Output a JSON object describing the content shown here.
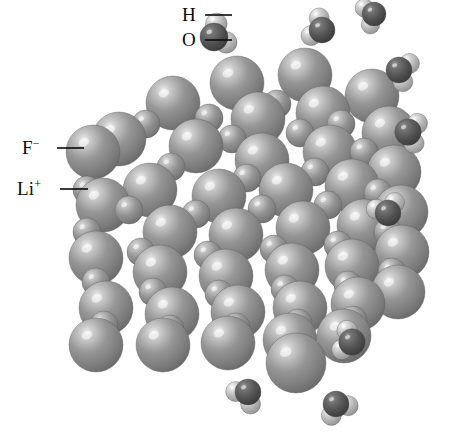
{
  "figure": {
    "name": "lithium-fluoride-crystal-dissolving-in-water",
    "background": "#ffffff",
    "width": 451,
    "height": 445
  },
  "labels": [
    {
      "id": "h",
      "text": "H",
      "sup": "",
      "x": 182,
      "y": 5,
      "leader": {
        "x1": 205,
        "y1": 15,
        "x2": 232,
        "y2": 15
      }
    },
    {
      "id": "o",
      "text": "O",
      "sup": "",
      "x": 182,
      "y": 30,
      "leader": {
        "x1": 205,
        "y1": 40,
        "x2": 232,
        "y2": 40
      }
    },
    {
      "id": "f",
      "text": "F",
      "sup": "−",
      "x": 22,
      "y": 138,
      "leader": {
        "x1": 57,
        "y1": 148,
        "x2": 84,
        "y2": 148
      }
    },
    {
      "id": "li",
      "text": "Li",
      "sup": "+",
      "x": 17,
      "y": 179,
      "leader": {
        "x1": 60,
        "y1": 189,
        "x2": 88,
        "y2": 189
      }
    }
  ],
  "species": {
    "fluoride": {
      "label": "F−",
      "role": "large anion",
      "base_color": "#8e8e8e",
      "highlight_color": "#e9e9e9",
      "shadow_color": "#5e5e5e",
      "radius_px": 27
    },
    "lithium": {
      "label": "Li+",
      "role": "small cation",
      "base_color": "#8e8e8e",
      "highlight_color": "#e0e0e0",
      "shadow_color": "#5e5e5e",
      "radius_px": 14
    },
    "oxygen": {
      "label": "O",
      "role": "water oxygen",
      "base_color": "#565656",
      "highlight_color": "#9a9a9a",
      "shadow_color": "#303030",
      "radius_px": 13
    },
    "hydrogen": {
      "label": "H",
      "role": "water hydrogen",
      "base_color": "#b4b4b4",
      "highlight_color": "#f2f2f2",
      "shadow_color": "#808080",
      "radius_px": 10
    }
  },
  "crystal": {
    "name": "lithium-fluoride-lattice",
    "lattice_type": "rock-salt (face-centered cubic)",
    "anion_positions": [
      [
        237,
        83
      ],
      [
        305,
        75
      ],
      [
        372,
        96
      ],
      [
        173,
        103
      ],
      [
        119,
        139
      ],
      [
        258,
        119
      ],
      [
        323,
        113
      ],
      [
        389,
        133
      ],
      [
        196,
        146
      ],
      [
        262,
        160
      ],
      [
        330,
        152
      ],
      [
        394,
        172
      ],
      [
        93,
        152
      ],
      [
        150,
        190
      ],
      [
        219,
        196
      ],
      [
        286,
        190
      ],
      [
        352,
        186
      ],
      [
        401,
        212
      ],
      [
        103,
        205
      ],
      [
        170,
        232
      ],
      [
        236,
        235
      ],
      [
        303,
        228
      ],
      [
        364,
        226
      ],
      [
        402,
        252
      ],
      [
        96,
        258
      ],
      [
        160,
        272
      ],
      [
        226,
        276
      ],
      [
        292,
        270
      ],
      [
        352,
        266
      ],
      [
        398,
        292
      ],
      [
        106,
        308
      ],
      [
        172,
        314
      ],
      [
        238,
        312
      ],
      [
        300,
        308
      ],
      [
        358,
        304
      ],
      [
        96,
        345
      ],
      [
        163,
        345
      ],
      [
        228,
        343
      ],
      [
        290,
        340
      ],
      [
        344,
        336
      ]
    ],
    "cation_positions": [
      [
        209,
        118
      ],
      [
        277,
        104
      ],
      [
        341,
        124
      ],
      [
        146,
        124
      ],
      [
        232,
        139
      ],
      [
        300,
        133
      ],
      [
        364,
        152
      ],
      [
        171,
        167
      ],
      [
        87,
        190
      ],
      [
        247,
        178
      ],
      [
        315,
        172
      ],
      [
        378,
        193
      ],
      [
        129,
        210
      ],
      [
        196,
        214
      ],
      [
        262,
        209
      ],
      [
        328,
        205
      ],
      [
        388,
        232
      ],
      [
        87,
        232
      ],
      [
        141,
        252
      ],
      [
        208,
        255
      ],
      [
        274,
        249
      ],
      [
        338,
        245
      ],
      [
        392,
        272
      ],
      [
        96,
        282
      ],
      [
        153,
        292
      ],
      [
        219,
        294
      ],
      [
        285,
        289
      ],
      [
        348,
        285
      ],
      [
        104,
        325
      ],
      [
        170,
        329
      ],
      [
        236,
        327
      ],
      [
        298,
        323
      ],
      [
        353,
        320
      ]
    ],
    "detached_ion": {
      "x": 296,
      "y": 363,
      "r": 30,
      "species": "fluoride"
    }
  },
  "water_molecules": [
    {
      "id": "labeled",
      "ox": 214,
      "oy": 37,
      "orient": -28,
      "scale": 1.08,
      "labeled": true
    },
    {
      "id": "w2",
      "ox": 322,
      "oy": 30,
      "orient": 205,
      "scale": 1.0,
      "labeled": false
    },
    {
      "id": "w3",
      "ox": 374,
      "oy": 14,
      "orient": 160,
      "scale": 0.92,
      "labeled": false
    },
    {
      "id": "w4",
      "ox": 399,
      "oy": 70,
      "orient": 20,
      "scale": 1.0,
      "labeled": false
    },
    {
      "id": "w5",
      "ox": 408,
      "oy": 132,
      "orient": 10,
      "scale": 1.02,
      "labeled": false
    },
    {
      "id": "w6",
      "ox": 388,
      "oy": 213,
      "orient": 250,
      "scale": 1.0,
      "labeled": false
    },
    {
      "id": "w7",
      "ox": 352,
      "oy": 342,
      "orient": 195,
      "scale": 1.02,
      "labeled": false
    },
    {
      "id": "w8",
      "ox": 248,
      "oy": 392,
      "orient": 130,
      "scale": 1.0,
      "labeled": false
    },
    {
      "id": "w9",
      "ox": 336,
      "oy": 404,
      "orient": 60,
      "scale": 1.0,
      "labeled": false
    }
  ]
}
